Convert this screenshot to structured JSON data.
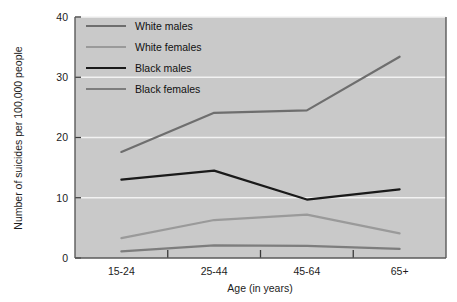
{
  "chart_data": {
    "type": "line",
    "title": "",
    "xlabel": "Age (in years)",
    "ylabel": "Number of suicides per 100,000 people",
    "categories": [
      "15-24",
      "25-44",
      "45-64",
      "65+"
    ],
    "ylim": [
      0,
      40
    ],
    "yticks": [
      0,
      10,
      20,
      30,
      40
    ],
    "ytick_labels": [
      "0",
      "10",
      "20",
      "30",
      "40"
    ],
    "grid": "horizontal-white",
    "legend_position": "top-left-inside",
    "plot_background": "#c9c9c9",
    "series": [
      {
        "name": "White males",
        "color": "#6e6e6e",
        "width": 2.2,
        "values": [
          17.6,
          24.1,
          24.5,
          33.4
        ]
      },
      {
        "name": "White females",
        "color": "#9a9a9a",
        "width": 2.2,
        "values": [
          3.3,
          6.3,
          7.2,
          4.1
        ]
      },
      {
        "name": "Black males",
        "color": "#1a1a1a",
        "width": 2.2,
        "values": [
          13.0,
          14.5,
          9.7,
          11.4
        ]
      },
      {
        "name": "Black females",
        "color": "#7d7d7d",
        "width": 2.2,
        "values": [
          1.1,
          2.1,
          2.0,
          1.5
        ]
      }
    ]
  },
  "axes": {
    "frame_color": "#5a5a5a",
    "tick_color": "#3a3a3a"
  }
}
